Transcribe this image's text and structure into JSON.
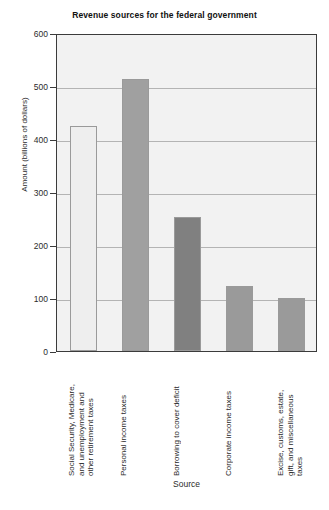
{
  "chart_data": {
    "type": "bar",
    "title": "Revenue sources for the federal government",
    "xlabel": "Source",
    "ylabel": "Amount (billions of dollars)",
    "ylim": [
      0,
      600
    ],
    "ytick_labels": [
      "600",
      "500",
      "400",
      "300",
      "200",
      "100",
      "0"
    ],
    "ytick_values": [
      600,
      500,
      400,
      300,
      200,
      100,
      0
    ],
    "grid": true,
    "legend": "none",
    "categories": [
      "Social Security, Medicare,\nand unemployment and\nother retirement taxes",
      "Personal income taxes",
      "Borrowing to cover deficit",
      "Corporate income taxes",
      "Excise, customs, estate,\ngift, and miscellaneous\ntaxes"
    ],
    "values": [
      425,
      513,
      252,
      122,
      100
    ],
    "bar_colors": [
      "#eeeeee",
      "#a0a0a0",
      "#808080",
      "#9a9a9a",
      "#9a9a9a"
    ],
    "plot_background": "#f2f2f2",
    "axis_color": "#3b3b3b",
    "gridline_color": "#b4b4b4"
  }
}
